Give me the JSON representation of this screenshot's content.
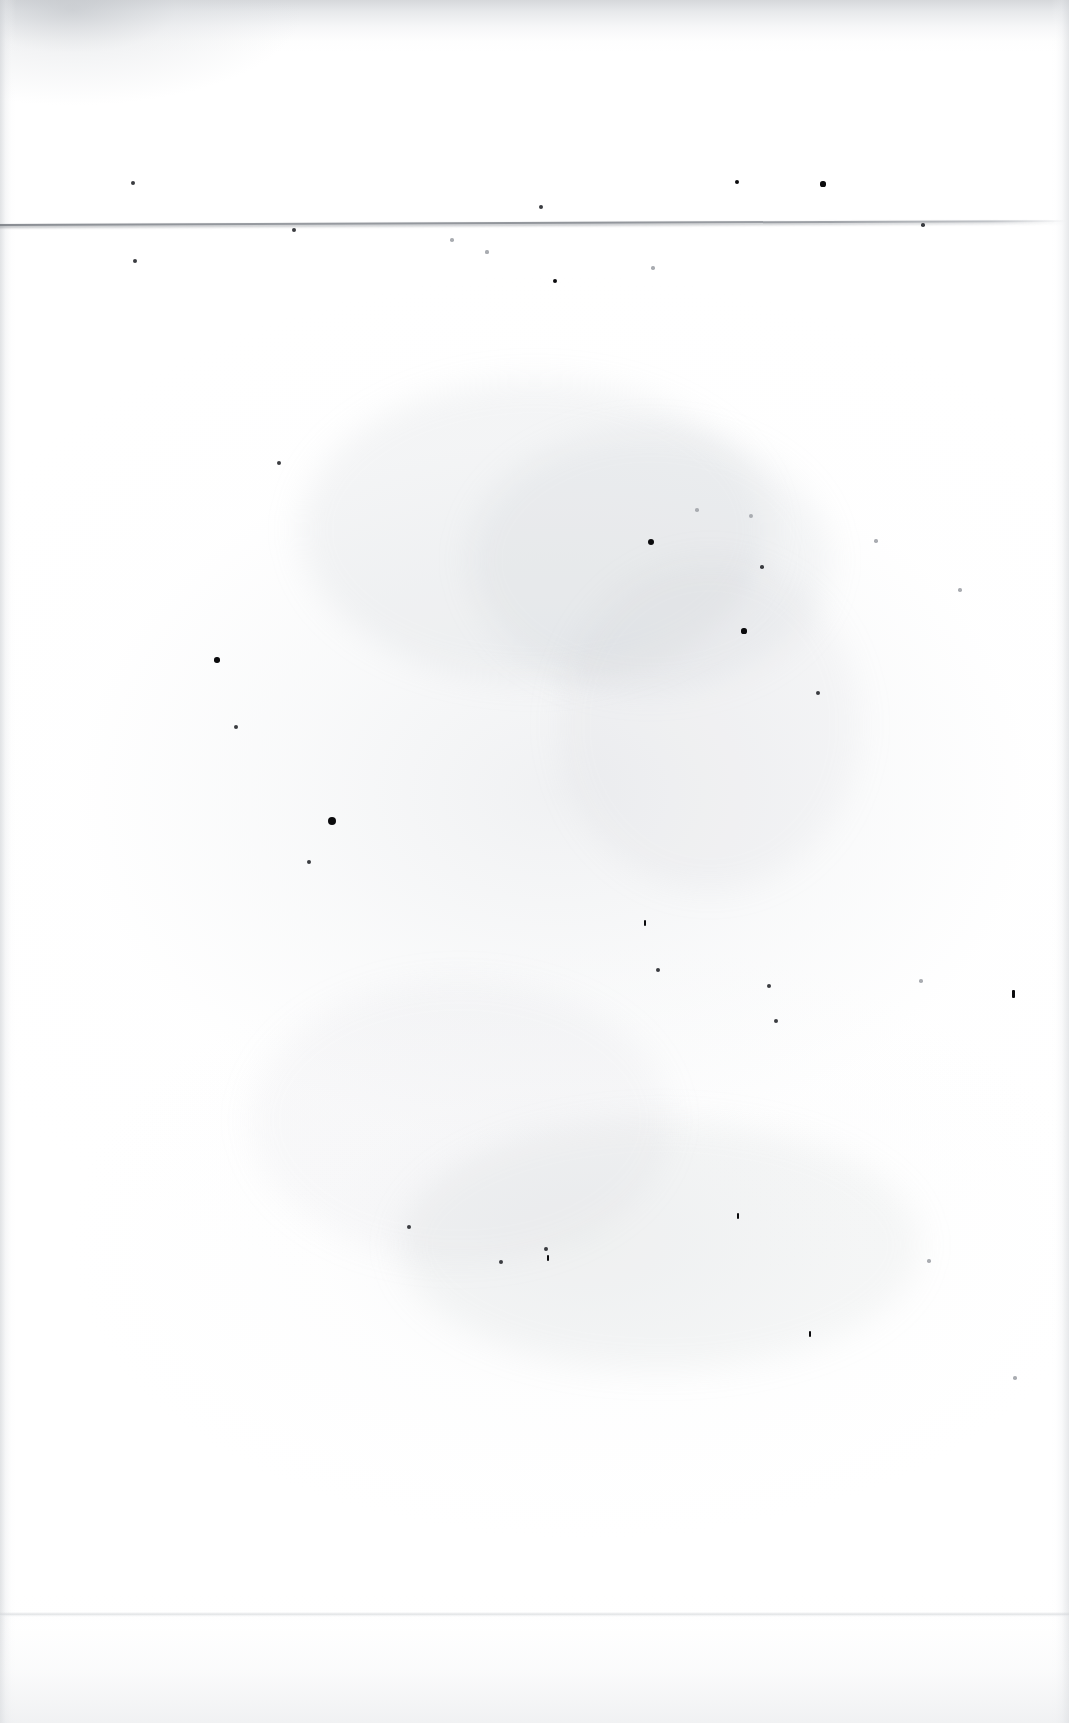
{
  "document": {
    "kind": "scanned-page",
    "page_content_text": "",
    "page_note": "",
    "width_px": 1069,
    "height_px": 1723,
    "background_color": "#ffffff",
    "ink_color": "#0b0b0d",
    "rule_color": "#8a8e94",
    "shadow_color": "#c8cbcf"
  },
  "artifacts": {
    "rule": {
      "label": "",
      "y_left": 226,
      "y_right": 222,
      "x_start": 0,
      "x_end": 1069,
      "thickness_px": 2
    },
    "bottom_edge": {
      "label": "",
      "y": 1614
    },
    "top_band": {
      "label": "",
      "height_px": 52
    },
    "specks": [
      {
        "x": 133,
        "y": 183,
        "r": 2.0,
        "tone": "mid"
      },
      {
        "x": 294,
        "y": 230,
        "r": 2.0,
        "tone": "mid"
      },
      {
        "x": 135,
        "y": 261,
        "r": 2.2,
        "tone": "mid"
      },
      {
        "x": 541,
        "y": 207,
        "r": 2.0,
        "tone": "mid"
      },
      {
        "x": 737,
        "y": 182,
        "r": 2.4,
        "tone": "dark"
      },
      {
        "x": 823,
        "y": 184,
        "r": 2.6,
        "tone": "dark"
      },
      {
        "x": 923,
        "y": 225,
        "r": 1.8,
        "tone": "mid"
      },
      {
        "x": 452,
        "y": 240,
        "r": 1.8,
        "tone": "pale"
      },
      {
        "x": 487,
        "y": 252,
        "r": 1.6,
        "tone": "pale"
      },
      {
        "x": 555,
        "y": 281,
        "r": 2.3,
        "tone": "dark"
      },
      {
        "x": 653,
        "y": 268,
        "r": 1.7,
        "tone": "pale"
      },
      {
        "x": 279,
        "y": 463,
        "r": 2.1,
        "tone": "mid"
      },
      {
        "x": 697,
        "y": 510,
        "r": 1.8,
        "tone": "pale"
      },
      {
        "x": 751,
        "y": 516,
        "r": 1.9,
        "tone": "pale"
      },
      {
        "x": 762,
        "y": 567,
        "r": 1.8,
        "tone": "mid"
      },
      {
        "x": 651,
        "y": 542,
        "r": 3.2,
        "tone": "dark"
      },
      {
        "x": 876,
        "y": 541,
        "r": 1.7,
        "tone": "pale"
      },
      {
        "x": 960,
        "y": 590,
        "r": 1.7,
        "tone": "pale"
      },
      {
        "x": 744,
        "y": 631,
        "r": 2.6,
        "tone": "dark"
      },
      {
        "x": 818,
        "y": 693,
        "r": 2.1,
        "tone": "mid"
      },
      {
        "x": 217,
        "y": 660,
        "r": 2.8,
        "tone": "dark"
      },
      {
        "x": 236,
        "y": 727,
        "r": 2.3,
        "tone": "mid"
      },
      {
        "x": 332,
        "y": 821,
        "r": 4.0,
        "tone": "dark"
      },
      {
        "x": 309,
        "y": 862,
        "r": 2.0,
        "tone": "mid"
      },
      {
        "x": 645,
        "y": 923,
        "r": 2.2,
        "tone": "dark",
        "shape": "bar"
      },
      {
        "x": 658,
        "y": 970,
        "r": 2.0,
        "tone": "mid"
      },
      {
        "x": 769,
        "y": 986,
        "r": 2.0,
        "tone": "mid"
      },
      {
        "x": 776,
        "y": 1021,
        "r": 2.0,
        "tone": "mid"
      },
      {
        "x": 921,
        "y": 981,
        "r": 1.8,
        "tone": "pale"
      },
      {
        "x": 1013,
        "y": 994,
        "r": 2.8,
        "tone": "dark",
        "shape": "bar"
      },
      {
        "x": 409,
        "y": 1227,
        "r": 2.1,
        "tone": "mid"
      },
      {
        "x": 738,
        "y": 1216,
        "r": 2.6,
        "tone": "dark",
        "shape": "bar"
      },
      {
        "x": 501,
        "y": 1262,
        "r": 2.0,
        "tone": "mid"
      },
      {
        "x": 546,
        "y": 1249,
        "r": 1.9,
        "tone": "mid"
      },
      {
        "x": 548,
        "y": 1258,
        "r": 2.6,
        "tone": "dark",
        "shape": "bar"
      },
      {
        "x": 810,
        "y": 1334,
        "r": 2.6,
        "tone": "dark",
        "shape": "bar"
      },
      {
        "x": 929,
        "y": 1261,
        "r": 1.7,
        "tone": "pale"
      },
      {
        "x": 1015,
        "y": 1378,
        "r": 1.8,
        "tone": "pale"
      }
    ],
    "clouds": [
      {
        "x": 300,
        "y": 380,
        "w": 470,
        "h": 300,
        "opacity": 0.16
      },
      {
        "x": 470,
        "y": 430,
        "w": 360,
        "h": 260,
        "opacity": 0.14
      },
      {
        "x": 400,
        "y": 1120,
        "w": 520,
        "h": 250,
        "opacity": 0.13
      },
      {
        "x": 560,
        "y": 560,
        "w": 300,
        "h": 330,
        "opacity": 0.1
      },
      {
        "x": 250,
        "y": 980,
        "w": 420,
        "h": 280,
        "opacity": 0.09
      }
    ]
  }
}
